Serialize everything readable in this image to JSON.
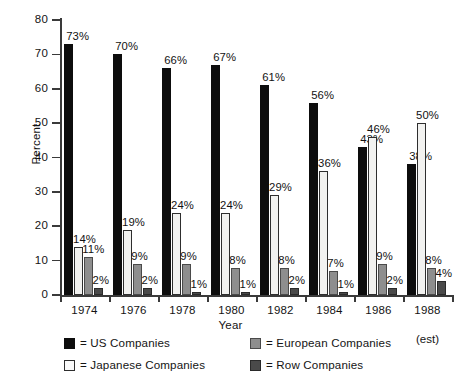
{
  "chart_data": {
    "type": "bar",
    "title": "",
    "xlabel": "Year",
    "ylabel": "Percent",
    "ylim": [
      0,
      80
    ],
    "yticks": [
      0,
      10,
      20,
      30,
      40,
      50,
      60,
      70,
      80
    ],
    "ytick_labels": [
      "0",
      "10",
      "20",
      "30",
      "40",
      "50",
      "60",
      "70",
      "80"
    ],
    "grid": false,
    "legend_position": "bottom",
    "categories": [
      "1974",
      "1976",
      "1978",
      "1980",
      "1982",
      "1984",
      "1986",
      "1988"
    ],
    "category_sublabels": [
      "",
      "",
      "",
      "",
      "",
      "",
      "",
      "(est)"
    ],
    "value_suffix": "%",
    "series": [
      {
        "name": "US Companies",
        "key": "us",
        "color": "#0d0d0d",
        "values": [
          73,
          70,
          66,
          67,
          61,
          56,
          43,
          38
        ],
        "labels": [
          "73%",
          "70%",
          "66%",
          "67%",
          "61%",
          "56%",
          "43%",
          "38%"
        ]
      },
      {
        "name": "Japanese Companies",
        "key": "jp",
        "color": "#f2f2f0",
        "values": [
          14,
          19,
          24,
          24,
          29,
          36,
          46,
          50
        ],
        "labels": [
          "14%",
          "19%",
          "24%",
          "24%",
          "29%",
          "36%",
          "46%",
          "50%"
        ]
      },
      {
        "name": "European Companies",
        "key": "eu",
        "color": "#8e8e8e",
        "values": [
          11,
          9,
          9,
          8,
          8,
          7,
          9,
          8
        ],
        "labels": [
          "11%",
          "9%",
          "9%",
          "8%",
          "8%",
          "7%",
          "9%",
          "8%"
        ]
      },
      {
        "name": "Row Companies",
        "key": "row",
        "color": "#4a4a4a",
        "values": [
          2,
          2,
          1,
          1,
          2,
          1,
          2,
          4
        ],
        "labels": [
          "2%",
          "2%",
          "1%",
          "1%",
          "2%",
          "1%",
          "2%",
          "4%"
        ]
      }
    ]
  },
  "legend": {
    "prefix": "= ",
    "items": [
      {
        "label": "= US Companies",
        "key": "us"
      },
      {
        "label": "= European Companies",
        "key": "eu"
      },
      {
        "label": "= Japanese Companies",
        "key": "jp"
      },
      {
        "label": "= Row Companies",
        "key": "row"
      }
    ]
  }
}
